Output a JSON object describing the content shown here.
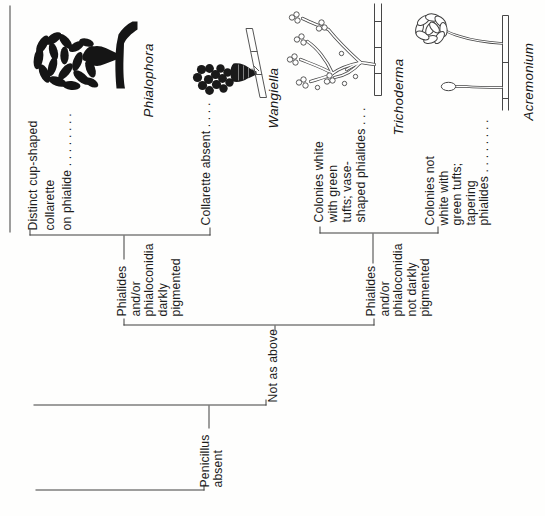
{
  "figure": {
    "kind": "dichotomous identification key (printed rotated 90° counterclockwise on page)",
    "topic": "phialide-bearing mould genera"
  },
  "colors": {
    "background": "#fefefd",
    "ink": "#1c1c1c",
    "line": "#3f3f3f"
  },
  "key": {
    "root": {
      "lines": [
        "Penicillus",
        "absent"
      ]
    },
    "not_as_above": {
      "label": "Not as above"
    },
    "node_dark": {
      "lines": [
        "Phialides",
        "and/or",
        "phialoconidia",
        "darkly",
        "pigmented"
      ]
    },
    "node_light": {
      "lines": [
        "Phialides",
        "and/or",
        "phialoconidia",
        "not darkly",
        "pigmented"
      ]
    },
    "leaves": [
      {
        "lines": [
          "Distinct cup-shaped",
          "collarette",
          "on phialide . . . . . . . ."
        ],
        "genus": "Phialophora",
        "illustration": "dark cluster of conidia on flask-shaped phialide on thick dark hypha"
      },
      {
        "lines": [
          "Collarette absent . . . ."
        ],
        "genus": "Wangiella",
        "illustration": "dark conidial head on annellated flask on pale septate hypha"
      },
      {
        "lines": [
          "Colonies white",
          "with green",
          "tufts; vase-",
          "shaped phialides . . ."
        ],
        "genus": "Trichoderma",
        "illustration": "branched conidiophore with small conidial balls at tips"
      },
      {
        "lines": [
          "Colonies not",
          "white with",
          "green tufts;",
          "tapering",
          "phialides . . . . . . . ."
        ],
        "genus": "Acremonium",
        "illustration": "long tapering phialides with conidial knot and single conidium on septate hypha"
      }
    ]
  }
}
